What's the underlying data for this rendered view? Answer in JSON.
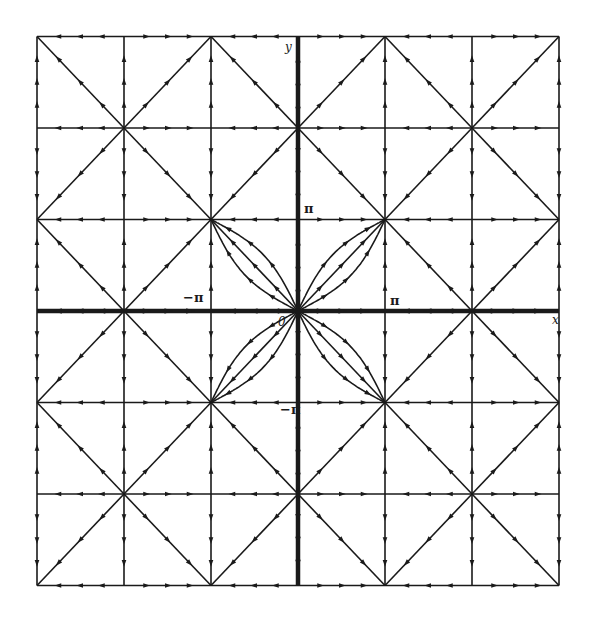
{
  "figure": {
    "title": "",
    "type": "phase portrait",
    "system": {
      "x_dot": "sin x",
      "y_dot": "sin y"
    },
    "colors": {
      "ink": "#1a1a1a",
      "background": "#ffffff"
    },
    "range_pi_units": {
      "x": [
        -3,
        3
      ],
      "y": [
        -3,
        3
      ]
    },
    "pixel_map": {
      "x0": 298,
      "x_per_pi": 87,
      "y0": 311,
      "y_per_pi": 91.5
    },
    "grid": {
      "line_width": 1.6,
      "axis_width": 4.5,
      "arrows_per_segment": 3
    },
    "node_types": {
      "source": "both indices even",
      "sink": "both indices odd",
      "saddle": "mixed parity"
    },
    "petals": {
      "around": [
        0,
        0
      ],
      "constants": [
        0.5,
        2
      ],
      "quadrants": [
        [
          1,
          1
        ],
        [
          -1,
          1
        ],
        [
          -1,
          -1
        ],
        [
          1,
          -1
        ]
      ]
    },
    "labels": {
      "x_axis": "x",
      "y_axis": "y",
      "origin": "0",
      "pi_right": "π",
      "pi_left": "−π",
      "pi_top": "π",
      "pi_bottom": "−π"
    }
  }
}
